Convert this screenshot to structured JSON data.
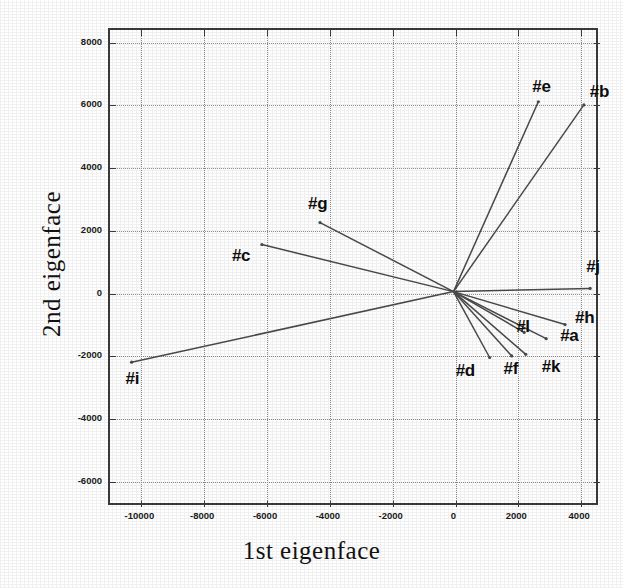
{
  "chart_data": {
    "type": "scatter",
    "title": "",
    "xlabel": "1st eigenface",
    "ylabel": "2nd eigenface",
    "xlim": [
      -11000,
      4600
    ],
    "ylim": [
      -6800,
      8400
    ],
    "xticks": [
      -10000,
      -8000,
      -6000,
      -4000,
      -2000,
      0,
      2000,
      4000
    ],
    "xtick_labels": [
      "-10000",
      "-8000",
      "-6000",
      "-4000",
      "-2000",
      "0",
      "2000",
      "4000"
    ],
    "yticks": [
      -6000,
      -4000,
      -2000,
      0,
      2000,
      4000,
      6000,
      8000
    ],
    "ytick_labels": [
      "-6000",
      "-4000",
      "-2000",
      "0",
      "2000",
      "4000",
      "6000",
      "8000"
    ],
    "grid": true,
    "legend": "none",
    "origin": [
      0,
      0
    ],
    "style": "vectors radiating from origin, each endpoint labeled",
    "points": [
      {
        "label": "#a",
        "x": 2950,
        "y": -1500,
        "label_dx": 14,
        "label_dy": 6
      },
      {
        "label": "#b",
        "x": 4150,
        "y": 5950,
        "label_dx": 6,
        "label_dy": -4
      },
      {
        "label": "#c",
        "x": -6100,
        "y": 1500,
        "label_dx": -30,
        "label_dy": 20
      },
      {
        "label": "#d",
        "x": 1150,
        "y": -2100,
        "label_dx": -34,
        "label_dy": 22
      },
      {
        "label": "#e",
        "x": 2700,
        "y": 6050,
        "label_dx": -6,
        "label_dy": -6
      },
      {
        "label": "#f",
        "x": 1850,
        "y": -2050,
        "label_dx": -8,
        "label_dy": 22
      },
      {
        "label": "#g",
        "x": -4250,
        "y": 2200,
        "label_dx": -12,
        "label_dy": -10
      },
      {
        "label": "#h",
        "x": 3550,
        "y": -1050,
        "label_dx": 10,
        "label_dy": 2
      },
      {
        "label": "#i",
        "x": -10250,
        "y": -2250,
        "label_dx": -6,
        "label_dy": 26
      },
      {
        "label": "#j",
        "x": 4350,
        "y": 100,
        "label_dx": -4,
        "label_dy": -12
      },
      {
        "label": "#k",
        "x": 2300,
        "y": -2000,
        "label_dx": 16,
        "label_dy": 22
      },
      {
        "label": "#l",
        "x": 2250,
        "y": -1300,
        "label_dx": -8,
        "label_dy": 4
      }
    ]
  },
  "colors": {
    "vector": "#4a4a4a",
    "frame": "#3b3b3b",
    "grid": "#8d8d8d",
    "text": "#0d0d0d",
    "background": "#ffffff"
  }
}
